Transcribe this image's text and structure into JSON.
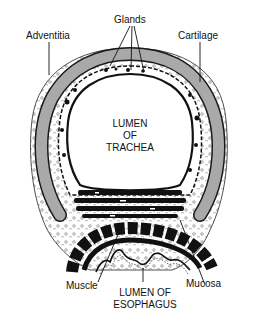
{
  "labels": {
    "glands": "Glands",
    "adventitia": "Adventitia",
    "cartilage": "Cartilage",
    "muscle": "Muscle",
    "mucosa": "Mucosa"
  },
  "lumen_trachea": [
    "LUMEN",
    "OF",
    "TRACHEA"
  ],
  "lumen_esophagus": [
    "LUMEN OF",
    "ESOPHAGUS"
  ],
  "colors": {
    "cartilage": "#a9a9a9",
    "ink": "#111111",
    "background": "#ffffff"
  }
}
